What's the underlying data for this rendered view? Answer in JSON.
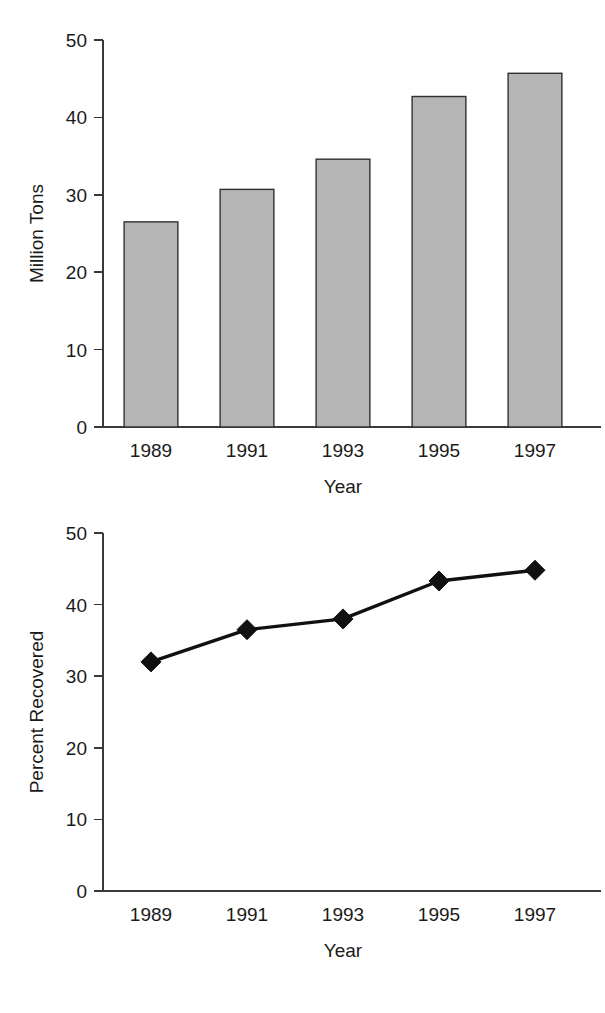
{
  "page": {
    "background_color": "#ffffff",
    "figure_count": 2
  },
  "chart_data": [
    {
      "id": "bar-chart",
      "type": "bar",
      "title": "",
      "subtitle": "",
      "xlabel": "Year",
      "ylabel": "Million Tons",
      "categories": [
        "1989",
        "1991",
        "1993",
        "1995",
        "1997"
      ],
      "values": [
        26.5,
        30.7,
        34.6,
        42.7,
        45.7
      ],
      "ylim": [
        0,
        50
      ],
      "yticks": [
        "0",
        "10",
        "20",
        "30",
        "40",
        "50"
      ],
      "ytick_values": [
        0,
        10,
        20,
        30,
        40,
        50
      ],
      "xticks": [
        "1989",
        "1991",
        "1993",
        "1995",
        "1997"
      ],
      "grid": false,
      "legend": false,
      "legend_position": "none",
      "bar_fill_color": "#b5b5b5",
      "bar_edge_color": "#303030",
      "axis_color": "#3a3a3a",
      "tick_direction": "outward"
    },
    {
      "id": "line-chart",
      "type": "line",
      "title": "",
      "subtitle": "",
      "xlabel": "Year",
      "ylabel": "Percent Recovered",
      "categories": [
        "1989",
        "1991",
        "1993",
        "1995",
        "1997"
      ],
      "values": [
        32.0,
        36.5,
        38.0,
        43.3,
        44.8
      ],
      "ylim": [
        0,
        50
      ],
      "yticks": [
        "0",
        "10",
        "20",
        "30",
        "40",
        "50"
      ],
      "ytick_values": [
        0,
        10,
        20,
        30,
        40,
        50
      ],
      "xticks": [
        "1989",
        "1991",
        "1993",
        "1995",
        "1997"
      ],
      "grid": false,
      "legend": false,
      "legend_position": "none",
      "line_color": "#111111",
      "marker": "diamond",
      "marker_color": "#111111",
      "axis_color": "#3a3a3a",
      "tick_direction": "outward"
    }
  ]
}
